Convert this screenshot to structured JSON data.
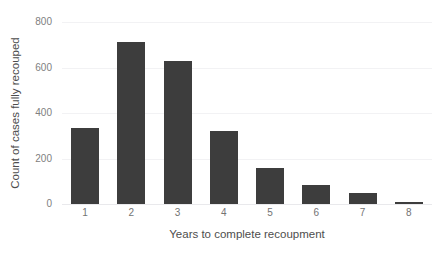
{
  "chart_data": {
    "type": "bar",
    "title": "",
    "xlabel": "Years to complete recoupment",
    "ylabel": "Count of cases fully recouped",
    "categories": [
      "1",
      "2",
      "3",
      "4",
      "5",
      "6",
      "7",
      "8"
    ],
    "values": [
      335,
      710,
      630,
      320,
      160,
      85,
      48,
      10
    ],
    "ylim": [
      0,
      800
    ],
    "yticks": [
      "0",
      "200",
      "400",
      "600",
      "800"
    ],
    "ytick_values": [
      0,
      200,
      400,
      600,
      800
    ],
    "grid": true,
    "legend": "none",
    "bar_color": "#3d3d3d",
    "grid_color": "#f2f2f4",
    "background": "#ffffff"
  }
}
